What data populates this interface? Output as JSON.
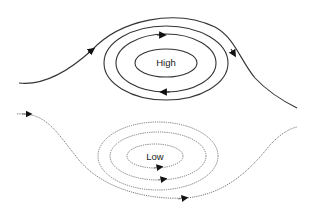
{
  "diagram": {
    "type": "pressure-system-airflow",
    "high": {
      "label": "High",
      "line_style": "solid",
      "rotation": "clockwise",
      "stroke": "#333333"
    },
    "low": {
      "label": "Low",
      "line_style": "dotted",
      "rotation": "counterclockwise",
      "stroke": "#777777"
    },
    "background": "#ffffff"
  }
}
